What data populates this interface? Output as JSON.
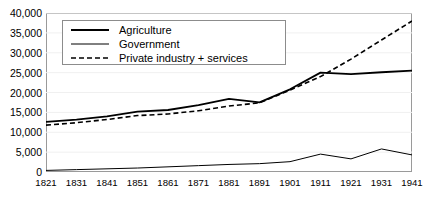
{
  "chart_data": {
    "type": "line",
    "title": "",
    "xlabel": "",
    "ylabel": "",
    "x": [
      1821,
      1831,
      1841,
      1851,
      1861,
      1871,
      1881,
      1891,
      1901,
      1911,
      1921,
      1931,
      1941
    ],
    "categories": [
      "1821",
      "1831",
      "1841",
      "1851",
      "1861",
      "1871",
      "1881",
      "1891",
      "1901",
      "1911",
      "1921",
      "1931",
      "1941"
    ],
    "xlim": [
      1821,
      1941
    ],
    "ylim": [
      0,
      40000
    ],
    "ytick_labels": [
      "40,000",
      "35,000",
      "30,000",
      "25,000",
      "20,000",
      "15,000",
      "10,000",
      "5,000",
      "0"
    ],
    "ytick_values": [
      40000,
      35000,
      30000,
      25000,
      20000,
      15000,
      10000,
      5000,
      0
    ],
    "grid": true,
    "legend_position": "top-left",
    "series": [
      {
        "name": "Agriculture",
        "style": "solid",
        "width": 1.8,
        "color": "#000000",
        "values": [
          12600,
          13200,
          14000,
          15200,
          15600,
          16800,
          18400,
          17500,
          20800,
          25000,
          24600,
          25100,
          25500
        ]
      },
      {
        "name": "Government",
        "style": "solid",
        "width": 1.0,
        "color": "#000000",
        "values": [
          400,
          600,
          800,
          1000,
          1300,
          1600,
          1900,
          2100,
          2600,
          4500,
          3300,
          5800,
          4300
        ]
      },
      {
        "name": "Private industry + services",
        "style": "dashed",
        "width": 1.6,
        "color": "#000000",
        "values": [
          11800,
          12400,
          13200,
          14200,
          14600,
          15400,
          16600,
          17400,
          20600,
          24000,
          28400,
          33200,
          38000
        ]
      }
    ]
  },
  "axis": {
    "frame_color": "#9a9a9a",
    "grid_color": "#f0f0f0"
  },
  "legend": {
    "items": [
      {
        "label": "Agriculture",
        "style": "solid",
        "width": 1.8
      },
      {
        "label": "Government",
        "style": "solid",
        "width": 1.0
      },
      {
        "label": "Private industry + services",
        "style": "dashed",
        "width": 1.6
      }
    ]
  }
}
